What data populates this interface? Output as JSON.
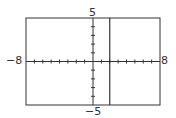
{
  "chart_data": {
    "type": "line",
    "title": "",
    "xlabel": "",
    "ylabel": "",
    "xlim": [
      -8,
      8
    ],
    "ylim": [
      -5,
      5
    ],
    "xtick_step": 1,
    "ytick_step": 1,
    "grid": false,
    "series": [
      {
        "name": "x = 2",
        "type": "vertical-line",
        "x": 2
      }
    ],
    "labels": {
      "xmin": "−8",
      "xmax": "8",
      "ymax": "5",
      "ymin": "−5"
    }
  },
  "colors": {
    "axis": "#333333",
    "frame": "#333333",
    "line": "#333333"
  }
}
